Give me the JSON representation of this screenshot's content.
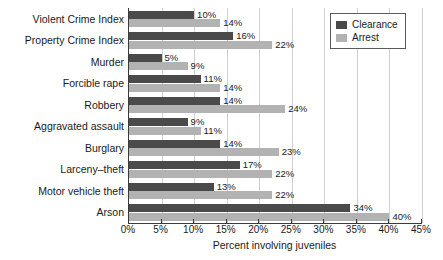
{
  "chart_data": {
    "type": "bar",
    "orientation": "horizontal",
    "title": "",
    "xlabel": "Percent involving juveniles",
    "ylabel": "",
    "xlim": [
      0,
      45
    ],
    "xtick_labels": [
      "0%",
      "5%",
      "10%",
      "15%",
      "20%",
      "25%",
      "30%",
      "35%",
      "40%",
      "45%"
    ],
    "xtick_values": [
      0,
      5,
      10,
      15,
      20,
      25,
      30,
      35,
      40,
      45
    ],
    "grid": true,
    "grid_axis": "x",
    "legend_position": "top-right",
    "categories": [
      "Violent Crime Index",
      "Property Crime Index",
      "Murder",
      "Forcible rape",
      "Robbery",
      "Aggravated assault",
      "Burglary",
      "Larceny–theft",
      "Motor vehicle theft",
      "Arson"
    ],
    "series": [
      {
        "name": "Clearance",
        "color": "#4a4a4a",
        "values": [
          10,
          16,
          5,
          11,
          14,
          9,
          14,
          17,
          13,
          34
        ],
        "labels": [
          "10%",
          "16%",
          "5%",
          "11%",
          "14%",
          "9%",
          "14%",
          "17%",
          "13%",
          "34%"
        ]
      },
      {
        "name": "Arrest",
        "color": "#b2b2b2",
        "values": [
          14,
          22,
          9,
          14,
          24,
          11,
          23,
          22,
          22,
          40
        ],
        "labels": [
          "14%",
          "22%",
          "9%",
          "14%",
          "24%",
          "11%",
          "23%",
          "22%",
          "22%",
          "40%"
        ]
      }
    ]
  },
  "legend": {
    "entries": [
      {
        "label": "Clearance",
        "color": "#4a4a4a"
      },
      {
        "label": "Arrest",
        "color": "#b2b2b2"
      }
    ]
  },
  "colors": {
    "clearance": "#4a4a4a",
    "arrest": "#b2b2b2",
    "axis": "#3a3a3a",
    "grid": "#cfcfcf",
    "background": "#ffffff",
    "text": "#1a1a1a"
  }
}
